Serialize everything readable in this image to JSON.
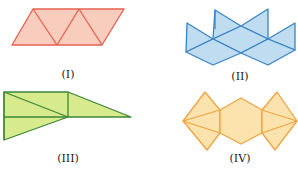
{
  "figures": [
    {
      "id": "I",
      "label": "(I)",
      "shape": "parallelogram of 4 equilateral triangles",
      "stroke": "#e6604f",
      "fill": "#f8cdbd"
    },
    {
      "id": "II",
      "label": "(II)",
      "shape": "net of triangles and rhombi",
      "stroke": "#3a84c6",
      "fill": "#bfdcf1"
    },
    {
      "id": "III",
      "label": "(III)",
      "shape": "rectangle with triangles",
      "stroke": "#3d8837",
      "fill": "#d7ea8e"
    },
    {
      "id": "IV",
      "label": "(IV)",
      "shape": "hexagon with triangles and kite sides",
      "stroke": "#eea441",
      "fill": "#fce3ad"
    }
  ]
}
